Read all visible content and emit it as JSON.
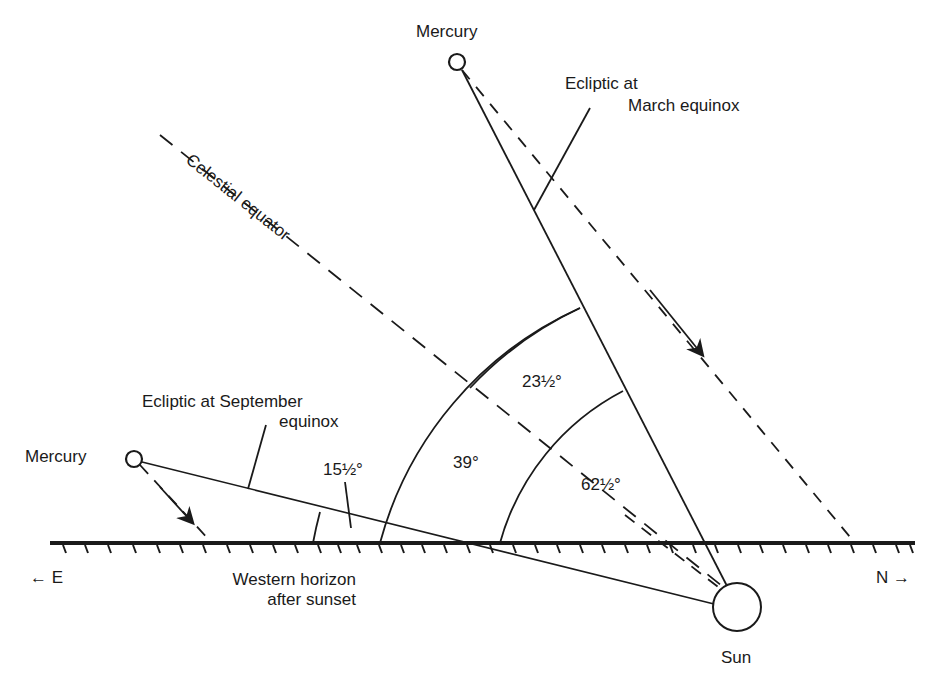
{
  "diagram": {
    "labels": {
      "mercury_top": "Mercury",
      "mercury_left": "Mercury",
      "ecliptic_march_line1": "Ecliptic at",
      "ecliptic_march_line2": "March equinox",
      "celestial_equator": "Celestial equator",
      "ecliptic_september_line1": "Ecliptic at September",
      "ecliptic_september_line2": "equinox",
      "horizon_line1": "Western horizon",
      "horizon_line2": "after sunset",
      "sun": "Sun",
      "east": "E",
      "north": "N"
    },
    "angles": {
      "a1": "15½°",
      "a2": "39°",
      "a3": "23½°",
      "a4": "62½°"
    },
    "icons": {
      "east_arrow": "←",
      "north_arrow": "→"
    },
    "colors": {
      "ink": "#1a1a1a",
      "background": "#ffffff"
    }
  }
}
